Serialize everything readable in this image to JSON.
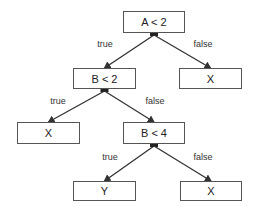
{
  "diagram": {
    "type": "decision-tree",
    "nodes": [
      {
        "id": "n1",
        "label": "A < 2",
        "x": 123,
        "y": 11,
        "w": 62,
        "h": 22
      },
      {
        "id": "n2",
        "label": "B < 2",
        "x": 73,
        "y": 68,
        "w": 63,
        "h": 21
      },
      {
        "id": "n3",
        "label": "X",
        "x": 179,
        "y": 68,
        "w": 63,
        "h": 21
      },
      {
        "id": "n4",
        "label": "X",
        "x": 17,
        "y": 122,
        "w": 63,
        "h": 22
      },
      {
        "id": "n5",
        "label": "B < 4",
        "x": 123,
        "y": 122,
        "w": 62,
        "h": 22
      },
      {
        "id": "n6",
        "label": "Y",
        "x": 73,
        "y": 181,
        "w": 63,
        "h": 20
      },
      {
        "id": "n7",
        "label": "X",
        "x": 180,
        "y": 181,
        "w": 62,
        "h": 20
      }
    ],
    "edges": [
      {
        "from": "n1",
        "to": "n2",
        "label": "true",
        "lx": 105,
        "ly": 44
      },
      {
        "from": "n1",
        "to": "n3",
        "label": "false",
        "lx": 203,
        "ly": 44
      },
      {
        "from": "n2",
        "to": "n4",
        "label": "true",
        "lx": 58,
        "ly": 101
      },
      {
        "from": "n2",
        "to": "n5",
        "label": "false",
        "lx": 155,
        "ly": 101
      },
      {
        "from": "n5",
        "to": "n6",
        "label": "true",
        "lx": 110,
        "ly": 157
      },
      {
        "from": "n5",
        "to": "n7",
        "label": "false",
        "lx": 203,
        "ly": 157
      }
    ]
  }
}
